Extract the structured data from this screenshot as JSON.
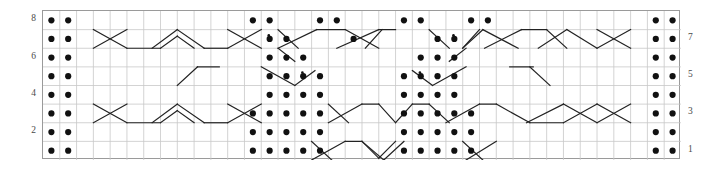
{
  "chart_data": {
    "type": "table",
    "title": "",
    "xlabel": "",
    "ylabel": "",
    "grid": {
      "columns": 38,
      "rows": 8,
      "cell_width": 16.789,
      "cell_height": 18.625,
      "grid_line_color": "#c8c8c8",
      "border_color": "#9a9a9a",
      "background": "#ffffff"
    },
    "row_labels_left": [
      {
        "row": 8,
        "label": "8"
      },
      {
        "row": 6,
        "label": "6"
      },
      {
        "row": 4,
        "label": "4"
      },
      {
        "row": 2,
        "label": "2"
      }
    ],
    "row_labels_right": [
      {
        "row": 7,
        "label": "7"
      },
      {
        "row": 5,
        "label": "5"
      },
      {
        "row": 3,
        "label": "3"
      },
      {
        "row": 1,
        "label": "1"
      }
    ],
    "symbols": {
      "dot": {
        "name": "purl-dot",
        "color": "#111111",
        "radius": 3.1
      },
      "small_dot": {
        "name": "small-purl-dot",
        "color": "#111111",
        "radius": 1.3
      },
      "line": {
        "name": "cable-cross-line",
        "color": "#222222",
        "width": 1.2
      }
    },
    "dots": [
      {
        "row": 8,
        "cols": [
          0,
          1,
          12,
          13,
          16,
          17,
          21,
          22,
          25,
          26,
          36,
          37
        ]
      },
      {
        "row": 7,
        "cols": [
          0,
          1,
          13,
          14,
          18,
          23,
          24,
          36,
          37
        ]
      },
      {
        "row": 6,
        "cols": [
          0,
          1,
          13,
          14,
          15,
          22,
          23,
          24,
          36,
          37
        ]
      },
      {
        "row": 5,
        "cols": [
          0,
          1,
          13,
          14,
          15,
          16,
          21,
          22,
          23,
          24,
          36,
          37
        ]
      },
      {
        "row": 4,
        "cols": [
          0,
          1,
          13,
          14,
          15,
          16,
          21,
          22,
          23,
          24,
          36,
          37
        ]
      },
      {
        "row": 3,
        "cols": [
          0,
          1,
          12,
          13,
          14,
          15,
          16,
          21,
          22,
          23,
          24,
          25,
          36,
          37
        ]
      },
      {
        "row": 2,
        "cols": [
          0,
          1,
          12,
          13,
          14,
          15,
          16,
          21,
          22,
          23,
          24,
          25,
          36,
          37
        ]
      },
      {
        "row": 1,
        "cols": [
          0,
          1,
          12,
          13,
          14,
          15,
          16,
          21,
          22,
          23,
          24,
          25,
          36,
          37
        ]
      }
    ],
    "small_dots": [
      {
        "row": 7,
        "col": 13
      },
      {
        "row": 7,
        "col": 24
      },
      {
        "row": 5,
        "col": 15
      },
      {
        "row": 5,
        "col": 22
      }
    ],
    "lines": [
      {
        "row": 7,
        "x1": 3.0,
        "y1": 0.0,
        "x2": 5.0,
        "y2": 1.0
      },
      {
        "row": 7,
        "x1": 3.0,
        "y1": 1.0,
        "x2": 5.0,
        "y2": 0.0
      },
      {
        "row": 7,
        "x1": 5.0,
        "y1": 1.0,
        "x2": 7.0,
        "y2": 1.0
      },
      {
        "row": 7,
        "x1": 7.0,
        "y1": 1.0,
        "x2": 8.0,
        "y2": 0.35
      },
      {
        "row": 7,
        "x1": 8.0,
        "y1": 0.35,
        "x2": 9.0,
        "y2": 1.0
      },
      {
        "row": 7,
        "x1": 6.5,
        "y1": 1.0,
        "x2": 8.0,
        "y2": 0.0
      },
      {
        "row": 7,
        "x1": 8.0,
        "y1": 0.0,
        "x2": 9.6,
        "y2": 1.0
      },
      {
        "row": 7,
        "x1": 9.6,
        "y1": 1.0,
        "x2": 11.0,
        "y2": 1.0
      },
      {
        "row": 7,
        "x1": 11.0,
        "y1": 1.0,
        "x2": 13.0,
        "y2": 0.0
      },
      {
        "row": 7,
        "x1": 11.0,
        "y1": 0.0,
        "x2": 13.0,
        "y2": 1.0
      },
      {
        "row": 7,
        "x1": 14.0,
        "y1": 0.0,
        "x2": 15.2,
        "y2": 1.0
      },
      {
        "row": 7,
        "x1": 14.0,
        "y1": 1.0,
        "x2": 16.3,
        "y2": 0.0
      },
      {
        "row": 7,
        "x1": 16.3,
        "y1": 0.0,
        "x2": 18.0,
        "y2": 0.0
      },
      {
        "row": 7,
        "x1": 18.0,
        "y1": 0.0,
        "x2": 20.0,
        "y2": 1.0
      },
      {
        "row": 7,
        "x1": 17.5,
        "y1": 1.0,
        "x2": 20.0,
        "y2": 0.0
      },
      {
        "row": 7,
        "x1": 20.0,
        "y1": 0.0,
        "x2": 21.0,
        "y2": 0.0
      },
      {
        "row": 7,
        "x1": 19.2,
        "y1": 1.0,
        "x2": 20.2,
        "y2": 0.0
      },
      {
        "row": 7,
        "x1": 23.0,
        "y1": 0.0,
        "x2": 24.2,
        "y2": 1.0
      },
      {
        "row": 7,
        "x1": 25.0,
        "y1": 1.0,
        "x2": 26.0,
        "y2": 0.0
      },
      {
        "row": 7,
        "x1": 25.0,
        "y1": 1.0,
        "x2": 26.2,
        "y2": 0.0
      },
      {
        "row": 7,
        "x1": 26.2,
        "y1": 0.0,
        "x2": 28.3,
        "y2": 1.0
      },
      {
        "row": 7,
        "x1": 26.3,
        "y1": 1.0,
        "x2": 28.5,
        "y2": 0.0
      },
      {
        "row": 7,
        "x1": 28.5,
        "y1": 0.0,
        "x2": 30.0,
        "y2": 0.0
      },
      {
        "row": 7,
        "x1": 30.0,
        "y1": 0.0,
        "x2": 31.2,
        "y2": 1.0
      },
      {
        "row": 7,
        "x1": 29.5,
        "y1": 1.0,
        "x2": 31.2,
        "y2": 0.0
      },
      {
        "row": 7,
        "x1": 31.2,
        "y1": 0.0,
        "x2": 33.0,
        "y2": 1.0
      },
      {
        "row": 7,
        "x1": 33.0,
        "y1": 1.0,
        "x2": 35.0,
        "y2": 0.0
      },
      {
        "row": 7,
        "x1": 33.0,
        "y1": 0.0,
        "x2": 35.0,
        "y2": 1.0
      },
      {
        "row": 6,
        "x1": 14.0,
        "y1": 0.0,
        "x2": 15.0,
        "y2": 0.7
      },
      {
        "row": 6,
        "x1": 24.2,
        "y1": 0.7,
        "x2": 25.2,
        "y2": 0.0
      },
      {
        "row": 5,
        "x1": 8.0,
        "y1": 1.0,
        "x2": 9.2,
        "y2": 0.0
      },
      {
        "row": 5,
        "x1": 9.2,
        "y1": 0.0,
        "x2": 10.5,
        "y2": 0.0
      },
      {
        "row": 5,
        "x1": 13.0,
        "y1": 0.0,
        "x2": 15.0,
        "y2": 1.0
      },
      {
        "row": 5,
        "x1": 15.0,
        "y1": 1.0,
        "x2": 16.2,
        "y2": 0.2
      },
      {
        "row": 5,
        "x1": 22.0,
        "y1": 0.2,
        "x2": 23.2,
        "y2": 1.0
      },
      {
        "row": 5,
        "x1": 23.2,
        "y1": 1.0,
        "x2": 25.2,
        "y2": 0.0
      },
      {
        "row": 5,
        "x1": 27.8,
        "y1": 0.0,
        "x2": 29.2,
        "y2": 0.0
      },
      {
        "row": 5,
        "x1": 29.0,
        "y1": 0.0,
        "x2": 30.2,
        "y2": 1.0
      },
      {
        "row": 3,
        "x1": 3.0,
        "y1": 0.0,
        "x2": 5.0,
        "y2": 1.0
      },
      {
        "row": 3,
        "x1": 3.0,
        "y1": 1.0,
        "x2": 5.0,
        "y2": 0.0
      },
      {
        "row": 3,
        "x1": 5.0,
        "y1": 1.0,
        "x2": 7.0,
        "y2": 1.0
      },
      {
        "row": 3,
        "x1": 7.0,
        "y1": 1.0,
        "x2": 8.0,
        "y2": 0.35
      },
      {
        "row": 3,
        "x1": 8.0,
        "y1": 0.35,
        "x2": 9.0,
        "y2": 1.0
      },
      {
        "row": 3,
        "x1": 6.5,
        "y1": 1.0,
        "x2": 8.0,
        "y2": 0.0
      },
      {
        "row": 3,
        "x1": 8.0,
        "y1": 0.0,
        "x2": 9.6,
        "y2": 1.0
      },
      {
        "row": 3,
        "x1": 9.6,
        "y1": 1.0,
        "x2": 11.0,
        "y2": 1.0
      },
      {
        "row": 3,
        "x1": 11.0,
        "y1": 1.0,
        "x2": 13.0,
        "y2": 0.0
      },
      {
        "row": 3,
        "x1": 11.0,
        "y1": 0.0,
        "x2": 13.0,
        "y2": 1.0
      },
      {
        "row": 3,
        "x1": 17.0,
        "y1": 0.0,
        "x2": 18.2,
        "y2": 1.0
      },
      {
        "row": 3,
        "x1": 17.0,
        "y1": 1.0,
        "x2": 19.0,
        "y2": 0.0
      },
      {
        "row": 3,
        "x1": 19.0,
        "y1": 0.0,
        "x2": 20.0,
        "y2": 0.0
      },
      {
        "row": 3,
        "x1": 20.0,
        "y1": 0.0,
        "x2": 21.0,
        "y2": 1.0
      },
      {
        "row": 3,
        "x1": 21.0,
        "y1": 1.0,
        "x2": 22.0,
        "y2": 0.0
      },
      {
        "row": 3,
        "x1": 22.0,
        "y1": 0.0,
        "x2": 23.0,
        "y2": 0.0
      },
      {
        "row": 3,
        "x1": 23.0,
        "y1": 0.0,
        "x2": 24.2,
        "y2": 1.0
      },
      {
        "row": 3,
        "x1": 24.0,
        "y1": 1.0,
        "x2": 26.0,
        "y2": 0.0
      },
      {
        "row": 3,
        "x1": 26.0,
        "y1": 0.0,
        "x2": 27.0,
        "y2": 0.0
      },
      {
        "row": 3,
        "x1": 27.0,
        "y1": 0.0,
        "x2": 29.0,
        "y2": 1.0
      },
      {
        "row": 3,
        "x1": 29.0,
        "y1": 1.0,
        "x2": 31.0,
        "y2": 1.0
      },
      {
        "row": 3,
        "x1": 31.0,
        "y1": 1.0,
        "x2": 33.0,
        "y2": 0.0
      },
      {
        "row": 3,
        "x1": 28.8,
        "y1": 1.0,
        "x2": 31.0,
        "y2": 0.0
      },
      {
        "row": 3,
        "x1": 31.0,
        "y1": 0.0,
        "x2": 33.0,
        "y2": 1.0
      },
      {
        "row": 3,
        "x1": 33.0,
        "y1": 1.0,
        "x2": 35.0,
        "y2": 0.0
      },
      {
        "row": 3,
        "x1": 33.0,
        "y1": 0.0,
        "x2": 35.0,
        "y2": 1.0
      },
      {
        "row": 1,
        "x1": 16.0,
        "y1": 0.0,
        "x2": 17.2,
        "y2": 1.0
      },
      {
        "row": 1,
        "x1": 16.0,
        "y1": 1.0,
        "x2": 18.0,
        "y2": 0.0
      },
      {
        "row": 1,
        "x1": 18.0,
        "y1": 0.0,
        "x2": 19.0,
        "y2": 0.0
      },
      {
        "row": 1,
        "x1": 19.0,
        "y1": 0.0,
        "x2": 20.0,
        "y2": 0.9
      },
      {
        "row": 1,
        "x1": 20.0,
        "y1": 0.9,
        "x2": 21.0,
        "y2": 0.0
      },
      {
        "row": 1,
        "x1": 19.0,
        "y1": 0.0,
        "x2": 20.3,
        "y2": 1.0
      },
      {
        "row": 1,
        "x1": 20.3,
        "y1": 1.0,
        "x2": 21.5,
        "y2": 0.0
      },
      {
        "row": 1,
        "x1": 25.0,
        "y1": 0.0,
        "x2": 26.2,
        "y2": 1.0
      },
      {
        "row": 1,
        "x1": 25.2,
        "y1": 1.0,
        "x2": 27.0,
        "y2": 0.0
      }
    ]
  }
}
